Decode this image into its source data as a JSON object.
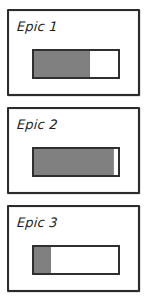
{
  "board": {
    "name": "epic-progress-board",
    "background_color": "#ffffff",
    "border_color": "#2b2b2b",
    "fill_color": "#808080",
    "track_color": "#ffffff"
  },
  "cards": [
    {
      "label": "Epic 1",
      "progress_percent": 67
    },
    {
      "label": "Epic 2",
      "progress_percent": 95
    },
    {
      "label": "Epic 3",
      "progress_percent": 20
    }
  ]
}
